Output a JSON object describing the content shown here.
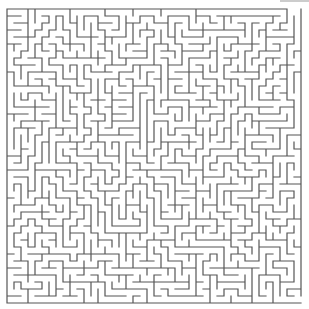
{
  "maze": {
    "width": 309,
    "height": 309,
    "cols": 42,
    "rows": 42,
    "cell_size": 7,
    "origin_x": 7,
    "origin_y": 9,
    "wall_color": "#555555",
    "background": "#ffffff",
    "entrance": "top-right",
    "exit": "bottom-right",
    "seed": 20240607
  }
}
